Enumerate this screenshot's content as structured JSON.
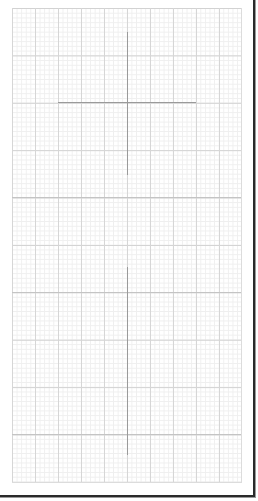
{
  "canvas": {
    "type": "graph-paper-grid",
    "grid_color_major": "#d2d2d2",
    "grid_color_minor": "#efefef",
    "frame_color": "#2a2a2a",
    "crosshair_color": "#9a9a9a"
  },
  "guides": {
    "upper_crosshair": {
      "center_x": 127,
      "center_y": 102
    },
    "lower_vertical_guide": {
      "x": 127,
      "y_start": 267,
      "y_end": 455
    }
  }
}
